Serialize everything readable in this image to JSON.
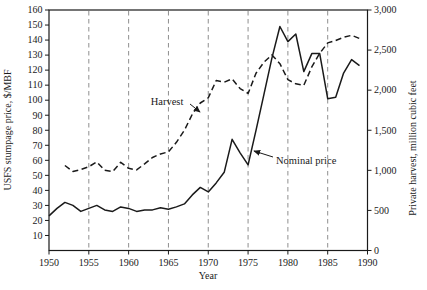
{
  "colors": {
    "line": "#1a1a1a",
    "gridline": "#8f8f8f",
    "background": "#ffffff",
    "text": "#1a1a1a"
  },
  "figure": {
    "x_axis": {
      "label": "Year",
      "tick_labels": [
        "1950",
        "1955",
        "1960",
        "1965",
        "1970",
        "1975",
        "1980",
        "1985",
        "1990"
      ],
      "tick_values": [
        1950,
        1955,
        1960,
        1965,
        1970,
        1975,
        1980,
        1985,
        1990
      ],
      "gridline_years": [
        1955,
        1960,
        1965,
        1970,
        1975,
        1980,
        1985
      ]
    },
    "left_axis": {
      "label": "USFS stumpage price, $/MBF",
      "tick_values": [
        10,
        20,
        30,
        40,
        50,
        60,
        70,
        80,
        90,
        100,
        110,
        120,
        130,
        140,
        150,
        160
      ]
    },
    "right_axis": {
      "label": "Private harvest, million cubic feet",
      "tick_labels": [
        "0",
        "500",
        "1,000",
        "1,500",
        "2,000",
        "2,500",
        "3,000"
      ],
      "tick_values": [
        0,
        500,
        1000,
        1500,
        2000,
        2500,
        3000
      ]
    },
    "annotations": [
      {
        "text": "Harvest",
        "text_x": 167,
        "text_y": 105,
        "anchor": "middle",
        "arrow_from": [
          190,
          104
        ],
        "arrow_to": [
          200,
          112
        ]
      },
      {
        "text": "Nominal price",
        "text_x": 276,
        "text_y": 164,
        "anchor": "start",
        "arrow_from": [
          273,
          157
        ],
        "arrow_to": [
          254,
          151
        ]
      }
    ]
  },
  "chart_data": {
    "type": "line",
    "title": "",
    "xlabel": "Year",
    "ylabel_left": "USFS stumpage price, $/MBF",
    "ylabel_right": "Private harvest, million cubic feet",
    "x_range": [
      1950,
      1990
    ],
    "left_ylim": [
      0,
      160
    ],
    "right_ylim": [
      0,
      3000
    ],
    "grid": "vertical-dashed",
    "legend": "inline-annotations",
    "series": [
      {
        "name": "Harvest",
        "axis": "right",
        "line_style": "dashed",
        "units": "million cubic feet",
        "x": [
          1952,
          1953,
          1954,
          1955,
          1956,
          1957,
          1958,
          1959,
          1960,
          1961,
          1962,
          1963,
          1964,
          1965,
          1966,
          1967,
          1968,
          1969,
          1970,
          1971,
          1972,
          1973,
          1974,
          1975,
          1976,
          1977,
          1978,
          1979,
          1980,
          1981,
          1982,
          1983,
          1984,
          1985,
          1986,
          1987,
          1988,
          1989
        ],
        "values": [
          1060,
          985,
          1010,
          1045,
          1105,
          1000,
          985,
          1100,
          1025,
          1005,
          1080,
          1160,
          1205,
          1230,
          1350,
          1500,
          1700,
          1840,
          1905,
          2120,
          2100,
          2140,
          2020,
          1960,
          2210,
          2350,
          2440,
          2330,
          2130,
          2080,
          2060,
          2290,
          2460,
          2590,
          2620,
          2660,
          2685,
          2645
        ]
      },
      {
        "name": "Nominal price",
        "axis": "left",
        "line_style": "solid",
        "units": "$/MBF",
        "x": [
          1950,
          1951,
          1952,
          1953,
          1954,
          1955,
          1956,
          1957,
          1958,
          1959,
          1960,
          1961,
          1962,
          1963,
          1964,
          1965,
          1966,
          1967,
          1968,
          1969,
          1970,
          1971,
          1972,
          1973,
          1974,
          1975,
          1976,
          1977,
          1978,
          1979,
          1980,
          1981,
          1982,
          1983,
          1984,
          1985,
          1986,
          1987,
          1988,
          1989
        ],
        "values": [
          23,
          28,
          32,
          30,
          26,
          28,
          30,
          27,
          26,
          29,
          28,
          26,
          27,
          27,
          28.5,
          27.5,
          29,
          31,
          37,
          42,
          39,
          45,
          52,
          74,
          65,
          57,
          80,
          104,
          128,
          149,
          139,
          144,
          119,
          131,
          131,
          101,
          102,
          118,
          127,
          123
        ]
      }
    ]
  }
}
